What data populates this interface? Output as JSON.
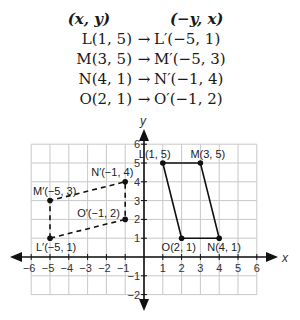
{
  "rules": {
    "header": {
      "preimage": "(x, y)",
      "image": "(−y, x)"
    },
    "arrow": "→",
    "mappings": [
      {
        "pre": "L(1, 5)",
        "img": "L′(−5, 1)"
      },
      {
        "pre": "M(3, 5)",
        "img": "M′(−5, 3)"
      },
      {
        "pre": "N(4, 1)",
        "img": "N′(−1, 4)"
      },
      {
        "pre": "O(2, 1)",
        "img": "O′(−1, 2)"
      }
    ]
  },
  "graph": {
    "x_axis_label": "x",
    "y_axis_label": "y",
    "x_ticks": [
      "−6",
      "−5",
      "−4",
      "−3",
      "−2",
      "−1",
      "1",
      "2",
      "3",
      "4",
      "5",
      "6"
    ],
    "y_ticks": [
      "−2",
      "−1",
      "1",
      "2",
      "3",
      "4",
      "5",
      "6"
    ],
    "original_points": [
      {
        "label": "L(1, 5)",
        "x": 1,
        "y": 5
      },
      {
        "label": "M(3, 5)",
        "x": 3,
        "y": 5
      },
      {
        "label": "N(4, 1)",
        "x": 4,
        "y": 1
      },
      {
        "label": "O(2, 1)",
        "x": 2,
        "y": 1
      }
    ],
    "image_points": [
      {
        "label": "L′(−5, 1)",
        "x": -5,
        "y": 1
      },
      {
        "label": "M′(−5, 3)",
        "x": -5,
        "y": 3
      },
      {
        "label": "N′(−1, 4)",
        "x": -1,
        "y": 4
      },
      {
        "label": "O′(−1, 2)",
        "x": -1,
        "y": 2
      }
    ],
    "colors": {
      "axis": "#111111",
      "grid": "#c8c8c8",
      "shape": "#111111"
    }
  }
}
